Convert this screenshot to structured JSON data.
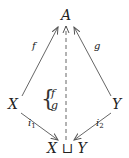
{
  "nodes": {
    "top": "A",
    "left": "X",
    "right": "Y",
    "bottom": "X ⊔ Y"
  },
  "arrows": {
    "left_to_top": {
      "label": "f"
    },
    "right_to_top": {
      "label": "g"
    },
    "left_to_bottom": {
      "label": "i",
      "sub": "1"
    },
    "right_to_bottom": {
      "label": "i",
      "sub": "2"
    },
    "bottom_to_top": {
      "style": "dashed"
    }
  },
  "brace": {
    "items": [
      "f",
      "g"
    ]
  },
  "colors": {
    "stroke": "#555555",
    "text": "#222222"
  }
}
